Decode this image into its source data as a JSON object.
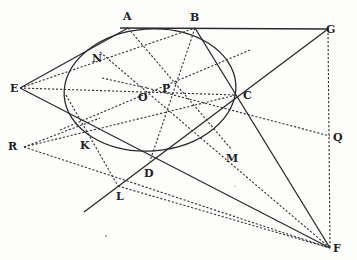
{
  "diagram": {
    "type": "geometry-conic-tangents",
    "ellipse": {
      "cx": 150,
      "cy": 90,
      "rx": 86,
      "ry": 61,
      "rotate": -4
    },
    "points": {
      "A": {
        "x": 128,
        "y": 28,
        "lx": 123,
        "ly": 20
      },
      "B": {
        "x": 195,
        "y": 28,
        "lx": 190,
        "ly": 21
      },
      "G": {
        "x": 328,
        "y": 29,
        "lx": 326,
        "ly": 31
      },
      "E": {
        "x": 20,
        "y": 88,
        "lx": 10,
        "ly": 92
      },
      "N": {
        "x": 100,
        "y": 52,
        "lx": 92,
        "ly": 62
      },
      "O": {
        "x": 147,
        "y": 88,
        "lx": 138,
        "ly": 101
      },
      "P": {
        "x": 168,
        "y": 82,
        "lx": 162,
        "ly": 92
      },
      "C": {
        "x": 236,
        "y": 95,
        "lx": 243,
        "ly": 99
      },
      "R": {
        "x": 24,
        "y": 147,
        "lx": 8,
        "ly": 150
      },
      "K": {
        "x": 90,
        "y": 133,
        "lx": 80,
        "ly": 149
      },
      "Q": {
        "x": 330,
        "y": 136,
        "lx": 333,
        "ly": 140
      },
      "M": {
        "x": 232,
        "y": 150,
        "lx": 226,
        "ly": 162
      },
      "D": {
        "x": 150,
        "y": 161,
        "lx": 144,
        "ly": 177
      },
      "L": {
        "x": 118,
        "y": 186,
        "lx": 116,
        "ly": 200
      },
      "F": {
        "x": 330,
        "y": 248,
        "lx": 333,
        "ly": 250
      }
    },
    "labels": [
      "A",
      "B",
      "G",
      "E",
      "N",
      "O",
      "P",
      "C",
      "R",
      "K",
      "Q",
      "M",
      "D",
      "L",
      "F"
    ]
  }
}
